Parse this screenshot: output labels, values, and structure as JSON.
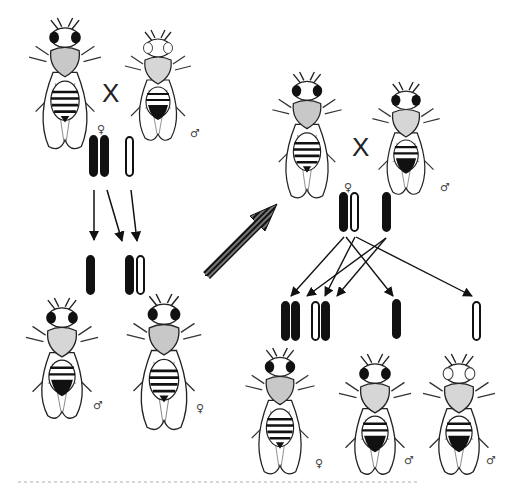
{
  "diagram": {
    "cross_symbol": "X",
    "female_symbol": "♀",
    "male_symbol": "♂",
    "generations": {
      "P": {
        "female": {
          "eye": "red",
          "sex": "♀",
          "chromosomes": [
            "filled",
            "filled"
          ]
        },
        "male": {
          "eye": "white",
          "sex": "♂",
          "chromosomes": [
            "hollow"
          ]
        }
      },
      "F1": {
        "male": {
          "eye": "red",
          "sex": "♂",
          "chromosomes": [
            "filled"
          ]
        },
        "female": {
          "eye": "red",
          "sex": "♀",
          "chromosomes": [
            "filled",
            "hollow"
          ]
        }
      },
      "F1_cross": {
        "female": {
          "eye": "red",
          "sex": "♀",
          "chromosomes": [
            "filled",
            "hollow"
          ]
        },
        "male": {
          "eye": "red",
          "sex": "♂",
          "chromosomes": [
            "filled"
          ]
        }
      },
      "F2": {
        "offspring_chromosomes": [
          [
            "filled",
            "filled"
          ],
          [
            "hollow",
            "filled"
          ],
          [
            "filled"
          ],
          [
            "hollow"
          ]
        ],
        "flies": [
          {
            "eye": "red",
            "sex": "♀"
          },
          {
            "eye": "red",
            "sex": "♂"
          },
          {
            "eye": "white",
            "sex": "♂"
          }
        ]
      }
    },
    "colors": {
      "ink": "#111111",
      "background": "#ffffff",
      "body_shade": "#bdbdbd"
    }
  }
}
